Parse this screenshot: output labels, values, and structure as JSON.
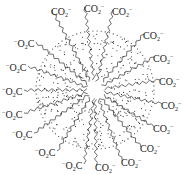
{
  "diagram": {
    "type": "micelle",
    "center": [
      95,
      90
    ],
    "core_radius": 60,
    "colors": {
      "line": "#333333",
      "dot": "#222222",
      "text": "#222222"
    },
    "labels": [
      {
        "id": "h1",
        "kind": "CO2-",
        "text": "CO",
        "x": 51,
        "y": 4
      },
      {
        "id": "h2",
        "kind": "CO2-",
        "text": "CO",
        "x": 84,
        "y": 1
      },
      {
        "id": "h3",
        "kind": "CO2-",
        "text": "CO",
        "x": 112,
        "y": 4
      },
      {
        "id": "h4",
        "kind": "CO2-",
        "text": "CO",
        "x": 143,
        "y": 28
      },
      {
        "id": "h5",
        "kind": "CO2-",
        "text": "CO",
        "x": 153,
        "y": 51
      },
      {
        "id": "h6",
        "kind": "CO2-",
        "text": "CO",
        "x": 159,
        "y": 74
      },
      {
        "id": "h7",
        "kind": "CO2-",
        "text": "CO",
        "x": 161,
        "y": 98
      },
      {
        "id": "h8",
        "kind": "CO2-",
        "text": "CO",
        "x": 153,
        "y": 121
      },
      {
        "id": "h9",
        "kind": "CO2-",
        "text": "CO",
        "x": 140,
        "y": 141
      },
      {
        "id": "h10",
        "kind": "CO2-",
        "text": "CO",
        "x": 121,
        "y": 155
      },
      {
        "id": "h11",
        "kind": "CO2-",
        "text": "CO",
        "x": 95,
        "y": 160
      },
      {
        "id": "h12",
        "kind": "O2C-",
        "text": "C",
        "x": 62,
        "y": 158
      },
      {
        "id": "h13",
        "kind": "O2C-",
        "text": "C",
        "x": 35,
        "y": 145
      },
      {
        "id": "h14",
        "kind": "O2C-",
        "text": "C",
        "x": 12,
        "y": 127
      },
      {
        "id": "h15",
        "kind": "O2C-",
        "text": "C",
        "x": 2,
        "y": 107
      },
      {
        "id": "h16",
        "kind": "O2C-",
        "text": "C",
        "x": 2,
        "y": 84
      },
      {
        "id": "h17",
        "kind": "O2C-",
        "text": "C",
        "x": 6,
        "y": 60
      },
      {
        "id": "h18",
        "kind": "O2C-",
        "text": "C",
        "x": 14,
        "y": 36
      }
    ]
  }
}
